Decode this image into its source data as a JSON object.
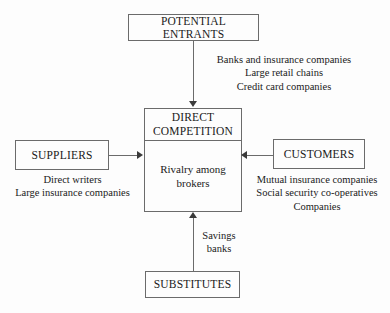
{
  "diagram": {
    "type": "five-forces",
    "background_color": "#fdfdfd",
    "line_color": "#6b6b6b",
    "text_color": "#1a1a1a"
  },
  "boxes": {
    "potential_entrants": {
      "label": "POTENTIAL ENTRANTS"
    },
    "direct_competition": {
      "header": "DIRECT\nCOMPETITION",
      "body": "Rivalry among\nbrokers"
    },
    "suppliers": {
      "label": "SUPPLIERS"
    },
    "customers": {
      "label": "CUSTOMERS"
    },
    "substitutes": {
      "label": "SUBSTITUTES"
    }
  },
  "notes": {
    "entrants": "Banks and insurance companies\nLarge retail chains\nCredit card companies",
    "suppliers": "Direct writers\nLarge insurance companies",
    "customers": "Mutual insurance companies\nSocial security co-operatives\nCompanies",
    "substitutes": "Savings\nbanks"
  },
  "connectors": {
    "entrants_to_competition": {
      "direction": "down"
    },
    "suppliers_to_competition": {
      "direction": "right"
    },
    "customers_to_competition": {
      "direction": "left"
    },
    "substitutes_to_competition": {
      "direction": "up"
    }
  }
}
